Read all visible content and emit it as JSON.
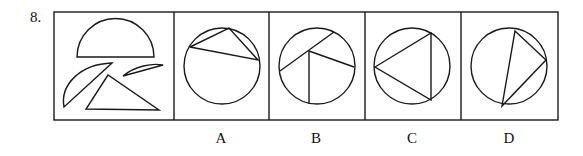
{
  "question": {
    "number": "8.",
    "stem_panel": {
      "shapes": [
        "semicircle",
        "circular-segment-large",
        "circular-segment-small",
        "triangle"
      ]
    },
    "options": [
      {
        "label": "A",
        "description": "circle with inscribed triangle near top"
      },
      {
        "label": "B",
        "description": "circle with chord and two lines meeting at interior point"
      },
      {
        "label": "C",
        "description": "circle with inscribed triangle pointing left"
      },
      {
        "label": "D",
        "description": "circle with inscribed narrow triangle"
      }
    ]
  },
  "colors": {
    "stroke": "#1a1a1a",
    "background": "#ffffff"
  }
}
